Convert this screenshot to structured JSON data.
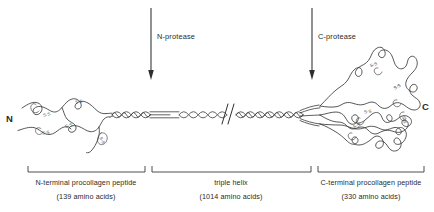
{
  "diagram": {
    "terminus_labels": {
      "n_terminus": "N",
      "c_terminus": "C"
    },
    "proteases": [
      {
        "id": "n-protease",
        "label": "N-protease",
        "arrow_x": 151
      },
      {
        "id": "c-protease",
        "label": "C-protease",
        "arrow_x": 312
      }
    ],
    "regions": [
      {
        "id": "n-terminal-propeptide",
        "label": "N-terminal procollagen peptide",
        "count": "(139 amino acids)",
        "bracket_start": 28,
        "bracket_end": 145
      },
      {
        "id": "triple-helix",
        "label": "triple helix",
        "count": "(1014 amino acids)",
        "bracket_start": 152,
        "bracket_end": 311
      },
      {
        "id": "c-terminal-propeptide",
        "label": "C-terminal procollagen peptide",
        "count": "(330 amino acids)",
        "bracket_start": 318,
        "bracket_end": 424
      }
    ],
    "disulfide_label": "S-S",
    "disulfide_bonds": [
      {
        "x": 47,
        "y": 116,
        "rot": -12
      },
      {
        "x": 79,
        "y": 103,
        "rot": -10
      },
      {
        "x": 46,
        "y": 134,
        "rot": -8
      },
      {
        "x": 69,
        "y": 127,
        "rot": -14
      },
      {
        "x": 100,
        "y": 141,
        "rot": 62
      },
      {
        "x": 374,
        "y": 66,
        "rot": -18
      },
      {
        "x": 398,
        "y": 88,
        "rot": -30
      },
      {
        "x": 368,
        "y": 113,
        "rot": -8
      },
      {
        "x": 357,
        "y": 127,
        "rot": -18
      },
      {
        "x": 402,
        "y": 120,
        "rot": 75
      }
    ],
    "colors": {
      "ink": "#3a3a3a",
      "background": "#ffffff",
      "accent": "#2e2e2e"
    }
  }
}
